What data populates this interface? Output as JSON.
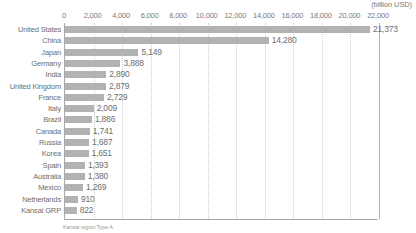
{
  "chart_data": {
    "type": "bar",
    "orientation": "horizontal",
    "title": "",
    "unit_label": "(billion USD)",
    "xlabel": "",
    "ylabel": "",
    "xlim": [
      0,
      22000
    ],
    "xticks": [
      0,
      2000,
      4000,
      6000,
      8000,
      10000,
      12000,
      14000,
      16000,
      18000,
      20000,
      22000
    ],
    "xtick_labels": [
      "0",
      "2,000",
      "4,000",
      "6,000",
      "8,000",
      "10,000",
      "12,000",
      "14,000",
      "16,000",
      "18,000",
      "20,000",
      "22,000"
    ],
    "grid": true,
    "legend": false,
    "categories": [
      "United States",
      "China",
      "Japan",
      "Germany",
      "India",
      "United Kingdom",
      "France",
      "Italy",
      "Brazil",
      "Canada",
      "Russia",
      "Korea",
      "Spain",
      "Australia",
      "Mexico",
      "Netherlands",
      "Kansai GRP"
    ],
    "values": [
      21373,
      14280,
      5149,
      3888,
      2890,
      2879,
      2729,
      2009,
      1886,
      1741,
      1687,
      1651,
      1393,
      1380,
      1269,
      910,
      822
    ],
    "value_labels": [
      "21,373",
      "14,280",
      "5,149",
      "3,888",
      "2,890",
      "2,879",
      "2,729",
      "2,009",
      "1,886",
      "1,741",
      "1,687",
      "1,651",
      "1,393",
      "1,380",
      "1,269",
      "910",
      "822"
    ],
    "bar_color": "#b2b2b2",
    "caption": "Kansai region Type A"
  }
}
